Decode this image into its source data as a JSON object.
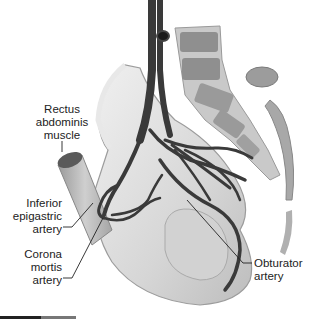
{
  "figure": {
    "labels": {
      "rectus": [
        "Rectus",
        "abdominis",
        "muscle"
      ],
      "inferior_epigastric": [
        "Inferior",
        "epigastric",
        "artery"
      ],
      "corona_mortis": [
        "Corona",
        "mortis",
        "artery"
      ],
      "obturator": [
        "Obturator",
        "artery"
      ]
    },
    "colors": {
      "artery": "#3a3a3a",
      "bone": "#d9d9d9",
      "bone_shadow": "#a8a8a8",
      "vertebra": "#8f8f8f",
      "leader_line": "#222222"
    }
  }
}
